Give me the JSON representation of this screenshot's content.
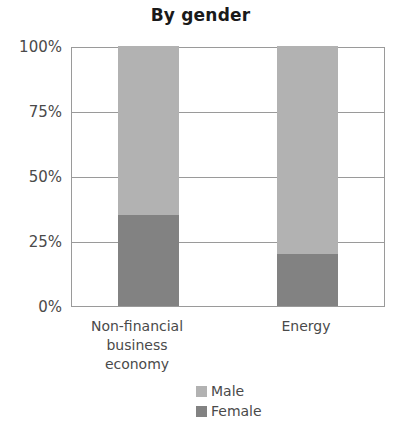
{
  "chart_data": {
    "type": "bar",
    "subtype": "stacked-100-percent",
    "title": "By gender",
    "xlabel": "",
    "ylabel": "",
    "categories": [
      "Non-financial business economy",
      "Energy"
    ],
    "category_lines": [
      [
        "Non-financial",
        "business economy"
      ],
      [
        "Energy"
      ]
    ],
    "series": [
      {
        "name": "Male",
        "values": [
          65,
          80
        ],
        "color": "#b2b2b2"
      },
      {
        "name": "Female",
        "values": [
          35,
          20
        ],
        "color": "#828282"
      }
    ],
    "stack_order_bottom_to_top": [
      "Female",
      "Male"
    ],
    "ylim": [
      0,
      100
    ],
    "yticks": [
      0,
      25,
      50,
      75,
      100
    ],
    "ytick_labels": [
      "0%",
      "25%",
      "50%",
      "75%",
      "100%"
    ],
    "grid": true,
    "grid_axis": "y",
    "legend": {
      "position": "bottom-center",
      "orientation": "vertical",
      "entries": [
        {
          "label": "Male",
          "color": "#b2b2b2"
        },
        {
          "label": "Female",
          "color": "#828282"
        }
      ]
    },
    "axis_color": "#9a9a9a",
    "text_color": "#4a4a4a",
    "title_color": "#1a1a1a",
    "background": "#ffffff"
  }
}
